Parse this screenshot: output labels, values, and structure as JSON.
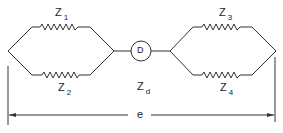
{
  "diagram": {
    "type": "bridge-circuit",
    "labels": {
      "z1": {
        "main": "Z",
        "sub": "1"
      },
      "z2": {
        "main": "Z",
        "sub": "2"
      },
      "z3": {
        "main": "Z",
        "sub": "3"
      },
      "z4": {
        "main": "Z",
        "sub": "4"
      },
      "zd": {
        "main": "Z",
        "sub": "d"
      },
      "detector": "D",
      "span": "e"
    },
    "line_color": "#333333"
  }
}
